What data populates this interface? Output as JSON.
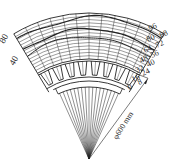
{
  "diagram": {
    "type": "sector-field-map",
    "left_scale_labels": [
      "80",
      "40"
    ],
    "right_scale_labels_outer": [
      "96",
      "80",
      "64",
      "48",
      "32",
      "16",
      "0"
    ],
    "right_scale_labels_inner": [
      "88",
      "72",
      "56",
      "40",
      "24",
      "8"
    ],
    "dimension_label": "φ600 mm",
    "colors": {
      "line": "#222222",
      "background": "#ffffff"
    }
  }
}
